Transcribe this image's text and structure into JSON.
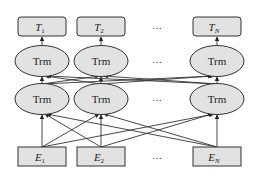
{
  "diagram": {
    "type": "bert-architecture",
    "colors": {
      "node_fill": "#e2e2e2",
      "stroke": "#333333",
      "background": "#ffffff"
    },
    "outputs": [
      {
        "base": "T",
        "sub": "1"
      },
      {
        "base": "T",
        "sub": "2"
      },
      {
        "base": "T",
        "sub": "N"
      }
    ],
    "top_layer": [
      {
        "label": "Trm"
      },
      {
        "label": "Trm"
      },
      {
        "label": "Trm"
      }
    ],
    "bottom_layer": [
      {
        "label": "Trm"
      },
      {
        "label": "Trm"
      },
      {
        "label": "Trm"
      }
    ],
    "inputs": [
      {
        "base": "E",
        "sub": "1"
      },
      {
        "base": "E",
        "sub": "2"
      },
      {
        "base": "E",
        "sub": "N"
      }
    ],
    "ellipsis": "…"
  }
}
